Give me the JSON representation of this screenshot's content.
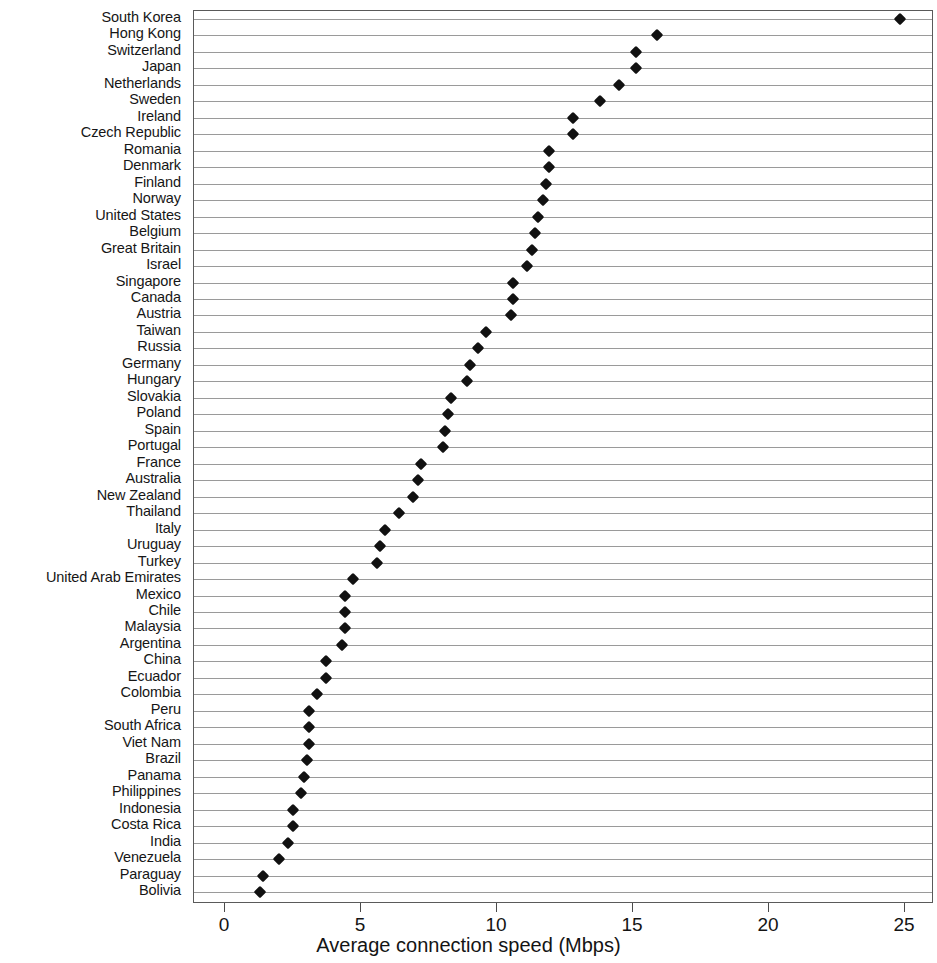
{
  "chart_data": {
    "type": "scatter",
    "title": "",
    "xlabel": "Average connection speed (Mbps)",
    "ylabel": "",
    "xlim": [
      0,
      27.2
    ],
    "xticks": [
      0,
      5,
      10,
      15,
      20,
      25
    ],
    "xtick_labels": [
      "0",
      "5",
      "10",
      "15",
      "20",
      "25"
    ],
    "grid": "horizontal-row-lines",
    "marker": "filled-diamond",
    "marker_color": "#111111",
    "orientation": "horizontal",
    "categories": [
      "South Korea",
      "Hong Kong",
      "Switzerland",
      "Japan",
      "Netherlands",
      "Sweden",
      "Ireland",
      "Czech Republic",
      "Romania",
      "Denmark",
      "Finland",
      "Norway",
      "United States",
      "Belgium",
      "Great Britain",
      "Israel",
      "Singapore",
      "Canada",
      "Austria",
      "Taiwan",
      "Russia",
      "Germany",
      "Hungary",
      "Slovakia",
      "Poland",
      "Spain",
      "Portugal",
      "France",
      "Australia",
      "New Zealand",
      "Thailand",
      "Italy",
      "Uruguay",
      "Turkey",
      "United Arab Emirates",
      "Mexico",
      "Chile",
      "Malaysia",
      "Argentina",
      "China",
      "Ecuador",
      "Colombia",
      "Peru",
      "South Africa",
      "Viet Nam",
      "Brazil",
      "Panama",
      "Philippines",
      "Indonesia",
      "Costa Rica",
      "India",
      "Venezuela",
      "Paraguay",
      "Bolivia"
    ],
    "values": [
      24.8,
      15.9,
      15.1,
      15.1,
      14.5,
      13.8,
      12.8,
      12.8,
      11.9,
      11.9,
      11.8,
      11.7,
      11.5,
      11.4,
      11.3,
      11.1,
      10.6,
      10.6,
      10.5,
      9.6,
      9.3,
      9.0,
      8.9,
      8.3,
      8.2,
      8.1,
      8.0,
      7.2,
      7.1,
      6.9,
      6.4,
      5.9,
      5.7,
      5.6,
      4.7,
      4.4,
      4.4,
      4.4,
      4.3,
      3.7,
      3.7,
      3.4,
      3.1,
      3.1,
      3.1,
      3.0,
      2.9,
      2.8,
      2.5,
      2.5,
      2.3,
      2.0,
      1.4,
      1.3
    ]
  }
}
